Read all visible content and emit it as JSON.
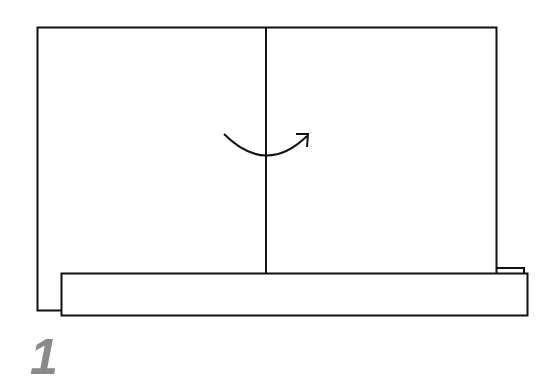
{
  "diagram": {
    "type": "folding-instruction",
    "step_number": "1",
    "colors": {
      "stroke": "#111111",
      "background": "#ffffff",
      "step_number": "#8a8a8a"
    },
    "elements": [
      {
        "name": "paper-sheet",
        "shape": "rectangle"
      },
      {
        "name": "center-fold-line",
        "shape": "line",
        "orientation": "vertical"
      },
      {
        "name": "fold-arrow",
        "shape": "curved-arrow",
        "direction": "left-to-right"
      },
      {
        "name": "bottom-strip",
        "shape": "rectangle"
      }
    ]
  }
}
